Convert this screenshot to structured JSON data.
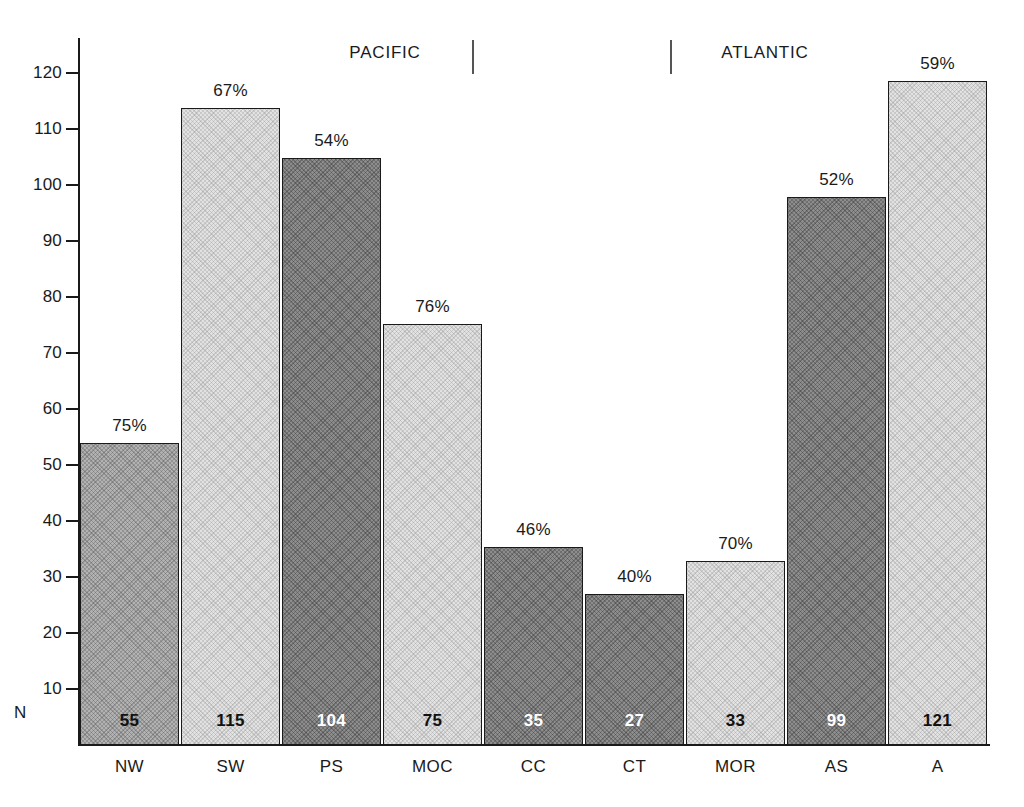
{
  "chart_data": {
    "type": "bar",
    "title": "",
    "subtitle": "",
    "xlabel": "",
    "ylabel": "",
    "ylim": [
      0,
      125
    ],
    "ytick_step": 10,
    "yticks": [
      10,
      20,
      30,
      40,
      50,
      60,
      70,
      80,
      90,
      100,
      110,
      120
    ],
    "ytick_labels": [
      "10",
      "20",
      "30",
      "40",
      "50",
      "60",
      "70",
      "80",
      "90",
      "100",
      "110",
      "120"
    ],
    "n_axis_label": "N",
    "grid": false,
    "legend": "none",
    "categories": [
      "NW",
      "SW",
      "PS",
      "MOC",
      "CC",
      "CT",
      "MOR",
      "AS",
      "A"
    ],
    "values": [
      54,
      113.8,
      104.8,
      75.2,
      35.3,
      27,
      32.8,
      97.8,
      118.5
    ],
    "bar_value_labels": [
      "75%",
      "67%",
      "54%",
      "76%",
      "46%",
      "40%",
      "70%",
      "52%",
      "59%"
    ],
    "percentages": [
      75,
      67,
      54,
      76,
      46,
      40,
      70,
      52,
      59
    ],
    "n_labels": [
      "55",
      "115",
      "104",
      "75",
      "35",
      "27",
      "33",
      "99",
      "121"
    ],
    "n_values": [
      55,
      115,
      104,
      75,
      35,
      27,
      33,
      99,
      121
    ],
    "shades": [
      "mid",
      "light",
      "dark",
      "light",
      "dark",
      "dark",
      "light",
      "dark",
      "light"
    ],
    "groups": [
      {
        "label": "PACIFIC",
        "categories": [
          "NW",
          "SW",
          "PS",
          "MOC"
        ]
      },
      {
        "label": "ATLANTIC",
        "categories": [
          "MOR",
          "AS",
          "A"
        ]
      }
    ],
    "group_labels": [
      "PACIFIC",
      "ATLANTIC"
    ],
    "colors": {
      "light": "#e2e2e2",
      "mid": "#b2b2b2",
      "dark": "#8d8d8d",
      "outline": "#1a1a1a",
      "background": "#ffffff",
      "text": "#1a1a1a"
    }
  }
}
